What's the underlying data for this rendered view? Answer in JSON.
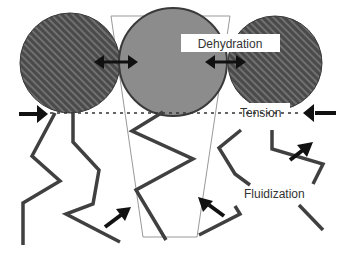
{
  "diagram": {
    "labels": {
      "dehydration": "Dehydration",
      "tension": "Tension",
      "fluidization": "Fluidization"
    },
    "colors": {
      "hatched_head_fill": "#4a4a4a",
      "hatched_stripe": "#6e6e6e",
      "center_head_fill": "#8c8c8c",
      "outline": "#444444",
      "chain": "#3f3f3f",
      "arrow": "#111111",
      "trapezoid": "#999999"
    },
    "elements": [
      {
        "type": "headgroup",
        "style": "hatched",
        "position": "left"
      },
      {
        "type": "headgroup",
        "style": "solid-gray",
        "position": "center"
      },
      {
        "type": "headgroup",
        "style": "hatched",
        "position": "right"
      },
      {
        "type": "trapezoid",
        "meaning": "molecular shape / cone"
      },
      {
        "type": "double-arrow",
        "between": "left-center"
      },
      {
        "type": "double-arrow",
        "between": "center-right"
      },
      {
        "type": "arrow",
        "direction": "inward-right",
        "at": "left tension"
      },
      {
        "type": "arrow",
        "direction": "inward-left",
        "at": "right tension"
      },
      {
        "type": "dotted-line",
        "meaning": "tension plane"
      },
      {
        "type": "acyl-chains",
        "count": 6
      }
    ]
  }
}
